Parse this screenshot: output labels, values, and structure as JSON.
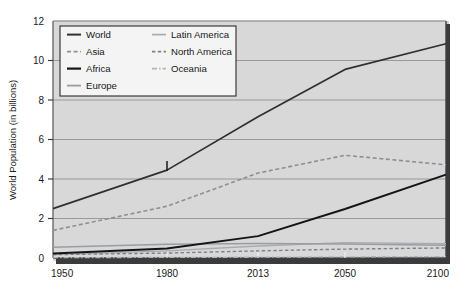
{
  "chart_data": {
    "type": "line",
    "title": "",
    "subtitle": "",
    "xlabel": "",
    "ylabel": "World Population (in billions)",
    "xlim": [
      1950,
      2100
    ],
    "ylim": [
      0,
      12
    ],
    "grid": true,
    "legend_position": "top-left-inside",
    "x_tick_labels": [
      "1950",
      "1980",
      "2013",
      "2050",
      "2100"
    ],
    "x_ticks": [
      1950,
      1980,
      2013,
      2050,
      2100
    ],
    "y_tick_labels": [
      "0",
      "2",
      "4",
      "6",
      "8",
      "10",
      "12"
    ],
    "y_ticks": [
      0,
      2,
      4,
      6,
      8,
      10,
      12
    ],
    "x": [
      1950,
      1980,
      2013,
      2050,
      2100
    ],
    "series": [
      {
        "name": "World",
        "values": [
          2.5,
          4.45,
          7.15,
          9.55,
          10.85
        ],
        "color": "#2f3032",
        "width": 1.7,
        "dash": "none"
      },
      {
        "name": "Asia",
        "values": [
          1.4,
          2.62,
          4.3,
          5.2,
          4.72
        ],
        "color": "#8d8f93",
        "width": 1.6,
        "dash": "4,2.6"
      },
      {
        "name": "Africa",
        "values": [
          0.23,
          0.48,
          1.11,
          2.48,
          4.22
        ],
        "color": "#141516",
        "width": 1.9,
        "dash": "none"
      },
      {
        "name": "Europe",
        "values": [
          0.55,
          0.69,
          0.74,
          0.71,
          0.64
        ],
        "color": "#9a9c9f",
        "width": 1.5,
        "dash": "none"
      },
      {
        "name": "Latin America",
        "values": [
          0.17,
          0.36,
          0.61,
          0.78,
          0.73
        ],
        "color": "#a9abae",
        "width": 1.4,
        "dash": "none"
      },
      {
        "name": "North America",
        "values": [
          0.17,
          0.25,
          0.36,
          0.45,
          0.51
        ],
        "color": "#7f8184",
        "width": 1.4,
        "dash": "3.4,2.4"
      },
      {
        "name": "Oceania",
        "values": [
          0.02,
          0.03,
          0.04,
          0.06,
          0.07
        ],
        "color": "#b2b4b7",
        "width": 1.3,
        "dash": "5,2,1.6,2"
      }
    ],
    "legend_columns": [
      [
        "World",
        "Asia",
        "Africa",
        "Europe"
      ],
      [
        "Latin America",
        "North America",
        "Oceania"
      ]
    ],
    "annotations": [
      {
        "name": "tick-marker-1980",
        "x": 1980,
        "y": 4.45,
        "label": ""
      }
    ]
  },
  "colors": {
    "page_background": "#ffffff",
    "plot_background": "#d6d6d6",
    "outer_background": "#d4d4d4",
    "gridline": "#8e8f91",
    "axis": "#4a4b4d",
    "shadow": "#3a3b3d",
    "legend_background": "#f4f4f4",
    "legend_border": "#2a2b2d",
    "text": "#1a1a1a"
  }
}
